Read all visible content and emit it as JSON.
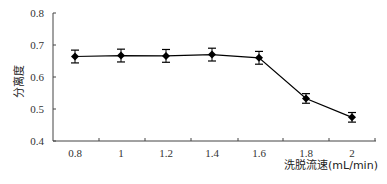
{
  "chart_data": {
    "type": "line",
    "title": "",
    "xlabel": "洗脱流速(mL/min)",
    "ylabel": "分离度",
    "x": [
      0.8,
      1,
      1.2,
      1.4,
      1.6,
      1.8,
      2
    ],
    "x_tick_labels": [
      "0.8",
      "1",
      "1.2",
      "1.4",
      "1.6",
      "1.8",
      "2"
    ],
    "y_tick_labels": [
      "0.4",
      "0.5",
      "0.6",
      "0.7",
      "0.8"
    ],
    "series": [
      {
        "name": "分离度",
        "values": [
          0.664,
          0.667,
          0.666,
          0.67,
          0.66,
          0.533,
          0.474
        ],
        "error": [
          0.02,
          0.02,
          0.02,
          0.02,
          0.02,
          0.015,
          0.015
        ],
        "marker": "diamond",
        "color": "#000000"
      }
    ],
    "ylim": [
      0.4,
      0.8
    ],
    "grid": false,
    "legend": "none"
  }
}
